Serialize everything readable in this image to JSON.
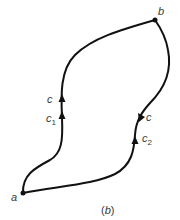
{
  "diagram": {
    "caption": {
      "open": "(",
      "letter": "b",
      "close": ")"
    },
    "points": [
      {
        "id": "a",
        "label": "a",
        "x": 23,
        "y": 193
      },
      {
        "id": "b",
        "label": "b",
        "x": 155,
        "y": 20
      }
    ],
    "paths": [
      {
        "id": "c1",
        "label": "c",
        "sub": "1",
        "direction": "a-to-b",
        "side": "left"
      },
      {
        "id": "c2",
        "label": "c",
        "sub": "2",
        "direction": "a-to-b",
        "side": "right"
      }
    ],
    "labels": {
      "a": "a",
      "b": "b",
      "c_left": "c",
      "c1_main": "c",
      "c1_sub": "1",
      "c_right": "c",
      "c2_main": "c",
      "c2_sub": "2"
    },
    "colors": {
      "stroke": "#111111",
      "text": "#3a3a3a",
      "background": "#ffffff"
    }
  }
}
